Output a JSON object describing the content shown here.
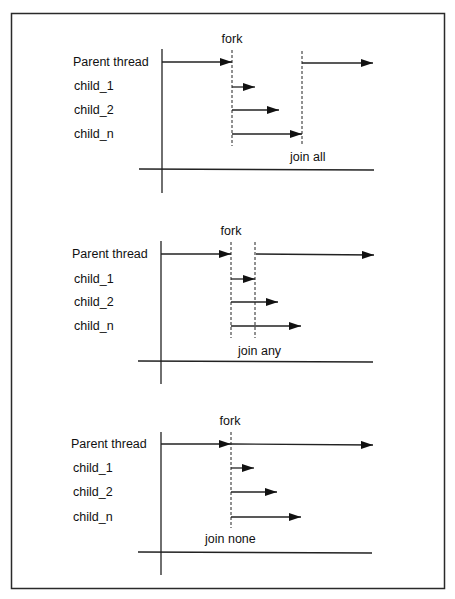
{
  "frame": {
    "stroke": "#2a2a2a",
    "line_color": "#222222"
  },
  "panels": [
    {
      "fork_label": "fork",
      "join_label": "join all",
      "rows": [
        {
          "label": "Parent thread"
        },
        {
          "label": "child_1"
        },
        {
          "label": "child_2"
        },
        {
          "label": "child_n"
        }
      ]
    },
    {
      "fork_label": "fork",
      "join_label": "join any",
      "rows": [
        {
          "label": "Parent thread"
        },
        {
          "label": "child_1"
        },
        {
          "label": "child_2"
        },
        {
          "label": "child_n"
        }
      ]
    },
    {
      "fork_label": "fork",
      "join_label": "join none",
      "rows": [
        {
          "label": "Parent thread"
        },
        {
          "label": "child_1"
        },
        {
          "label": "child_2"
        },
        {
          "label": "child_n"
        }
      ]
    }
  ]
}
